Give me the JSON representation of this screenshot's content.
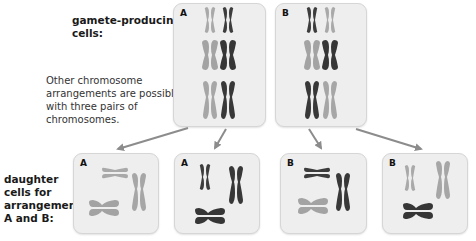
{
  "labels": {
    "gamete_cells": [
      "gamete-producing",
      "cells:"
    ],
    "note": [
      "Other chromosome",
      "arrangements are possible",
      "with three pairs of",
      "chromosomes."
    ],
    "daughter_cells": [
      "daughter",
      "cells for",
      "arrangements",
      "A and B:"
    ]
  },
  "parent_cells": [
    {
      "letter": "A"
    },
    {
      "letter": "B"
    }
  ],
  "daughter_cells_list": [
    {
      "letter": "A"
    },
    {
      "letter": "A"
    },
    {
      "letter": "B"
    },
    {
      "letter": "B"
    }
  ],
  "colors": {
    "light_chromosome": "#a8a8a8",
    "dark_chromosome": "#3a3a3a",
    "box_bg": "#eeeeee",
    "arrow": "#8c8c8c"
  }
}
